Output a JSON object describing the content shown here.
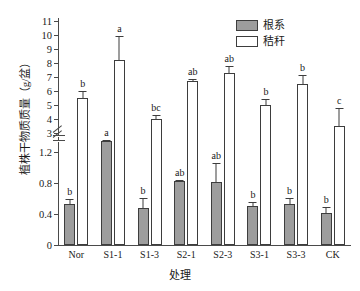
{
  "chart_data": {
    "type": "bar",
    "title": "",
    "xlabel": "处理",
    "ylabel": "植株干物质质量（g/盆）",
    "categories": [
      "Nor",
      "S1-1",
      "S1-3",
      "S2-1",
      "S2-3",
      "S3-1",
      "S3-3",
      "CK"
    ],
    "axis_break": true,
    "ylim_lower": [
      0,
      1.4
    ],
    "ylim_upper": [
      3,
      11
    ],
    "yticks_lower": [
      "0",
      "0.4",
      "0.8",
      "1.2"
    ],
    "yticks_upper": [
      "3",
      "4",
      "5",
      "6",
      "7",
      "8",
      "9",
      "10",
      "11"
    ],
    "grid": false,
    "legend_position": "top-right",
    "series": [
      {
        "name": "根系",
        "color": "#9d9d9d",
        "values": [
          0.53,
          1.35,
          0.48,
          0.83,
          0.82,
          0.51,
          0.53,
          0.42
        ],
        "errors": [
          0.08,
          0.02,
          0.14,
          0.03,
          0.25,
          0.06,
          0.09,
          0.09
        ],
        "letters": [
          "b",
          "a",
          "b",
          "ab",
          "ab",
          "b",
          "b",
          "b"
        ]
      },
      {
        "name": "秸秆",
        "color": "#ffffff",
        "values": [
          5.5,
          8.2,
          4.0,
          6.7,
          7.3,
          5.0,
          6.5,
          3.5
        ],
        "errors": [
          0.55,
          1.8,
          0.35,
          0.2,
          0.55,
          0.5,
          0.75,
          1.35
        ],
        "letters": [
          "b",
          "a",
          "bc",
          "ab",
          "ab",
          "b",
          "b",
          "c"
        ]
      }
    ]
  },
  "legend": {
    "items": [
      {
        "label": "根系",
        "swatch": "root"
      },
      {
        "label": "秸秆",
        "swatch": "straw"
      }
    ]
  }
}
